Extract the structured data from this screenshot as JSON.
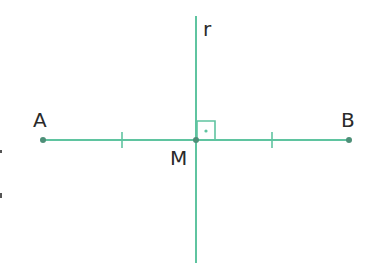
{
  "diagram": {
    "colors": {
      "line": "#5fc4a0",
      "point": "#4e8f78",
      "text": "#2a2a2a",
      "background": "#ffffff"
    },
    "points": [
      {
        "id": "A",
        "label": "A",
        "x": 43,
        "y": 140,
        "label_x": 33,
        "label_y": 127
      },
      {
        "id": "B",
        "label": "B",
        "x": 349,
        "y": 140,
        "label_x": 341,
        "label_y": 127
      },
      {
        "id": "M",
        "label": "M",
        "x": 196,
        "y": 140,
        "label_x": 170,
        "label_y": 165
      }
    ],
    "lines": [
      {
        "id": "segment-AB",
        "x1": 43,
        "y1": 140,
        "x2": 349,
        "y2": 140
      },
      {
        "id": "line-r",
        "label": "r",
        "x1": 196,
        "y1": 16,
        "x2": 196,
        "y2": 263,
        "label_x": 203,
        "label_y": 36
      }
    ],
    "tick_marks": [
      {
        "x": 122,
        "y": 140
      },
      {
        "x": 272,
        "y": 140
      }
    ],
    "right_angle": {
      "x": 197,
      "y": 121,
      "size": 18,
      "dot_x": 206,
      "dot_y": 131
    }
  }
}
